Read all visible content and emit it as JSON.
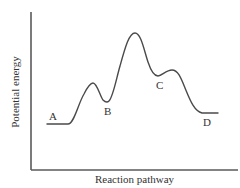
{
  "diagram": {
    "type": "energy-profile",
    "x_axis_label": "Reaction pathway",
    "y_axis_label": "Potential energy",
    "points": [
      {
        "id": "A",
        "label": "A",
        "kind": "reactant-plateau",
        "x": 52,
        "y": 116
      },
      {
        "id": "B",
        "label": "B",
        "kind": "intermediate-valley",
        "x": 105,
        "y": 110
      },
      {
        "id": "C",
        "label": "C",
        "kind": "intermediate-valley",
        "x": 156,
        "y": 85
      },
      {
        "id": "D",
        "label": "D",
        "kind": "product-plateau",
        "x": 204,
        "y": 122
      }
    ],
    "curve_shape": {
      "start_plateau_energy": "low",
      "first_peak": "small",
      "main_peak": "highest (rate-determining step, between B and C)",
      "third_peak": "small (after C)",
      "end_plateau_energy": "slightly above A"
    },
    "colors": {
      "background": "#ffffff",
      "axis": "#5a5a5a",
      "curve": "#4a4a4a",
      "text": "#333333"
    }
  }
}
